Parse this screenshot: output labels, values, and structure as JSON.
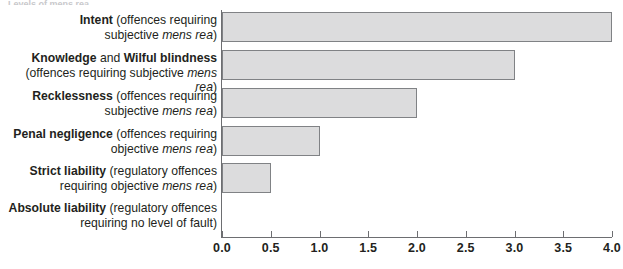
{
  "figure": {
    "caption_sliver": "Levels of mens rea",
    "accent_bar_fill": "#dcdcdd",
    "accent_bar_stroke": "#808285",
    "axis_color": "#6d6e71",
    "text_color": "#231f20"
  },
  "chart_data": {
    "type": "bar",
    "orientation": "horizontal",
    "title": "",
    "xlabel": "",
    "ylabel": "",
    "xlim": [
      0.0,
      4.0
    ],
    "grid": false,
    "legend": null,
    "categories": [
      "Intent (offences requiring subjective mens rea)",
      "Knowledge and Wilful blindness (offences requiring subjective mens rea)",
      "Recklessness (offences requiring subjective mens rea)",
      "Penal negligence (offences requiring objective mens rea)",
      "Strict liability (regulatory offences requiring objective mens rea)",
      "Absolute liability (regulatory offences requiring no level of fault)"
    ],
    "values": [
      4.0,
      3.0,
      2.0,
      1.0,
      0.5,
      0.0
    ],
    "tick_values": [
      0.0,
      0.5,
      1.0,
      1.5,
      2.0,
      2.5,
      3.0,
      3.5,
      4.0
    ],
    "tick_labels": [
      "0.0",
      "0.5",
      "1.0",
      "1.5",
      "2.0",
      "2.5",
      "3.0",
      "3.5",
      "4.0"
    ]
  },
  "rows": [
    {
      "value": 4.0,
      "label_lines": [
        [
          {
            "text": "Intent",
            "style": "bold"
          },
          {
            "text": " (offences requiring",
            "style": "normal"
          }
        ],
        [
          {
            "text": "subjective ",
            "style": "normal"
          },
          {
            "text": "mens rea",
            "style": "italic"
          },
          {
            "text": ")",
            "style": "normal"
          }
        ]
      ]
    },
    {
      "value": 3.0,
      "label_lines": [
        [
          {
            "text": "Knowledge",
            "style": "bold"
          },
          {
            "text": " and ",
            "style": "normal"
          },
          {
            "text": "Wilful blindness",
            "style": "bold"
          }
        ],
        [
          {
            "text": "(offences requiring subjective ",
            "style": "normal"
          },
          {
            "text": "mens rea",
            "style": "italic"
          },
          {
            "text": ")",
            "style": "normal"
          }
        ]
      ]
    },
    {
      "value": 2.0,
      "label_lines": [
        [
          {
            "text": "Recklessness",
            "style": "bold"
          },
          {
            "text": " (offences requiring",
            "style": "normal"
          }
        ],
        [
          {
            "text": "subjective ",
            "style": "normal"
          },
          {
            "text": "mens rea",
            "style": "italic"
          },
          {
            "text": ")",
            "style": "normal"
          }
        ]
      ]
    },
    {
      "value": 1.0,
      "label_lines": [
        [
          {
            "text": "Penal negligence",
            "style": "bold"
          },
          {
            "text": " (offences requiring",
            "style": "normal"
          }
        ],
        [
          {
            "text": "objective ",
            "style": "normal"
          },
          {
            "text": "mens rea",
            "style": "italic"
          },
          {
            "text": ")",
            "style": "normal"
          }
        ]
      ]
    },
    {
      "value": 0.5,
      "label_lines": [
        [
          {
            "text": "Strict liability",
            "style": "bold"
          },
          {
            "text": " (regulatory offences",
            "style": "normal"
          }
        ],
        [
          {
            "text": "requiring objective ",
            "style": "normal"
          },
          {
            "text": "mens rea",
            "style": "italic"
          },
          {
            "text": ")",
            "style": "normal"
          }
        ]
      ]
    },
    {
      "value": 0.0,
      "label_lines": [
        [
          {
            "text": "Absolute liability",
            "style": "bold"
          },
          {
            "text": " (regulatory offences",
            "style": "normal"
          }
        ],
        [
          {
            "text": "requiring no level of fault)",
            "style": "normal"
          }
        ]
      ]
    }
  ]
}
